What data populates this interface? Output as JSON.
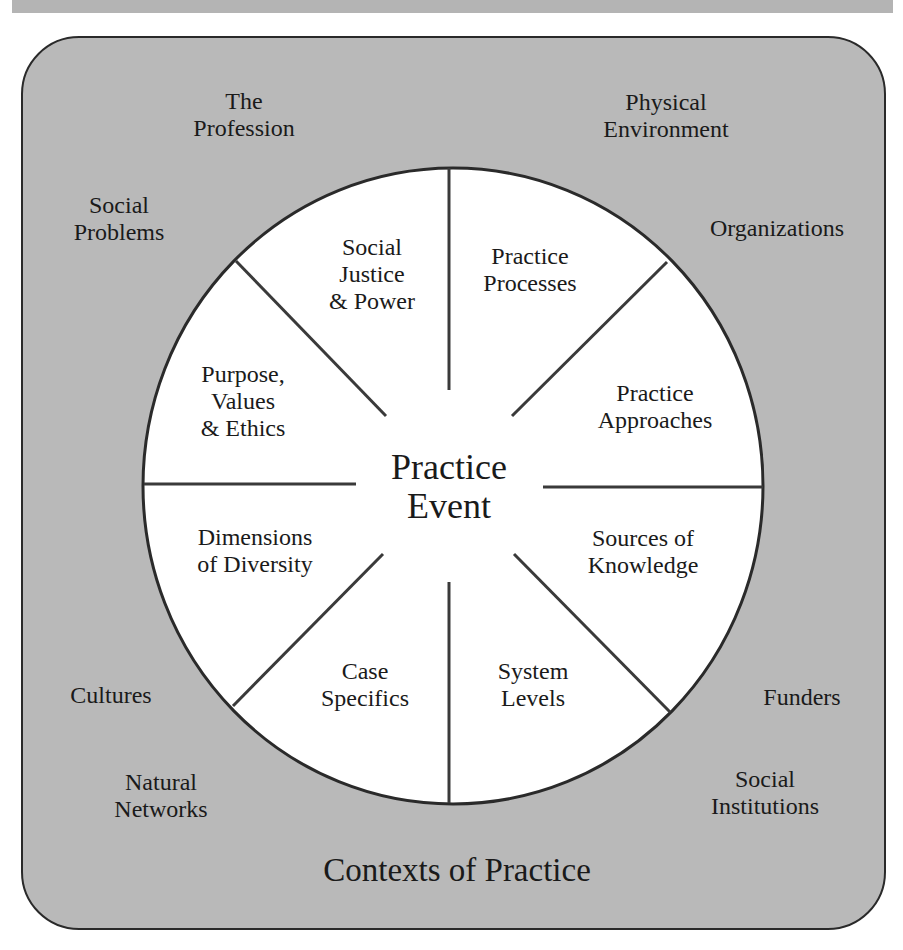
{
  "diagram": {
    "title": "Contexts of Practice",
    "center": "Practice\nEvent",
    "colors": {
      "context_fill": "#b9b9b9",
      "wheel_fill": "#ffffff",
      "stroke": "#2a2a2a",
      "text": "#1a1a1a"
    },
    "segments": [
      {
        "label": "Social\nJustice\n& Power"
      },
      {
        "label": "Practice\nProcesses"
      },
      {
        "label": "Practice\nApproaches"
      },
      {
        "label": "Sources of\nKnowledge"
      },
      {
        "label": "System\nLevels"
      },
      {
        "label": "Case\nSpecifics"
      },
      {
        "label": "Dimensions\nof Diversity"
      },
      {
        "label": "Purpose,\nValues\n& Ethics"
      }
    ],
    "contexts": [
      {
        "label": "The\nProfession"
      },
      {
        "label": "Physical\nEnvironment"
      },
      {
        "label": "Social\nProblems"
      },
      {
        "label": "Organizations"
      },
      {
        "label": "Cultures"
      },
      {
        "label": "Funders"
      },
      {
        "label": "Natural\nNetworks"
      },
      {
        "label": "Social\nInstitutions"
      }
    ]
  }
}
